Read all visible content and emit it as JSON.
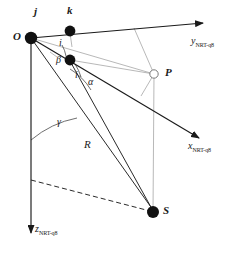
{
  "figure": {
    "kind": "geometry-diagram",
    "background_color": "#ffffff",
    "line_color": "#1a1a1a",
    "thin_line_color": "#8a8a8a",
    "node_fill_color": "#111111",
    "open_node_fill_color": "#ffffff"
  },
  "axes": [
    {
      "id": "y-axis",
      "name": "y-axis",
      "base_symbol": "y",
      "subscript": "NRT-q8",
      "label_x": 191,
      "label_y": 42,
      "from": [
        31,
        38
      ],
      "to": [
        206,
        22
      ],
      "arrow": true
    },
    {
      "id": "x-axis",
      "name": "x-axis",
      "base_symbol": "x",
      "subscript": "NRT-q8",
      "label_x": 188,
      "label_y": 147,
      "from": [
        31,
        38
      ],
      "to": [
        202,
        140
      ],
      "arrow": true
    },
    {
      "id": "z-axis",
      "name": "z-axis",
      "base_symbol": "z",
      "subscript": "NRT-q8",
      "label_x": 34,
      "label_y": 229,
      "from": [
        31,
        38
      ],
      "to": [
        31,
        236
      ],
      "arrow": true
    }
  ],
  "points": [
    {
      "id": "O",
      "name": "origin-point",
      "label": "O",
      "x": 31,
      "y": 38,
      "label_x": 14,
      "label_y": 33,
      "marker": "filled",
      "radius": 6
    },
    {
      "id": "j",
      "name": "point-j",
      "label": "j",
      "x": 31,
      "y": 38,
      "label_x": 34,
      "label_y": 9,
      "marker": "none",
      "radius": 0
    },
    {
      "id": "k",
      "name": "point-k",
      "label": "k",
      "x": 70,
      "y": 31,
      "label_x": 67,
      "label_y": 8,
      "marker": "filled",
      "radius": 5
    },
    {
      "id": "i",
      "name": "point-i",
      "label": "",
      "x": 70,
      "y": 60,
      "label_x": 0,
      "label_y": 0,
      "marker": "filled",
      "radius": 5
    },
    {
      "id": "P",
      "name": "point-P",
      "label": "P",
      "x": 154,
      "y": 74,
      "label_x": 165,
      "label_y": 70,
      "marker": "open",
      "radius": 4
    },
    {
      "id": "S",
      "name": "point-S",
      "label": "S",
      "x": 153,
      "y": 212,
      "label_x": 163,
      "label_y": 207,
      "marker": "filled",
      "radius": 6
    }
  ],
  "angles": [
    {
      "id": "alpha",
      "name": "angle-alpha",
      "label": "α",
      "label_x": 87,
      "label_y": 82
    },
    {
      "id": "beta",
      "name": "angle-beta",
      "label": "β",
      "label_x": 57,
      "label_y": 61
    },
    {
      "id": "i",
      "name": "angle-i",
      "label": "i",
      "label_x": 74,
      "label_y": 76
    },
    {
      "id": "gamma",
      "name": "angle-gamma",
      "label": "γ",
      "label_x": 57,
      "label_y": 122
    },
    {
      "id": "i-top",
      "name": "angle-i-top",
      "label": "i",
      "label_x": 59,
      "label_y": 43
    }
  ],
  "segments": [
    {
      "id": "R",
      "name": "segment-R",
      "label": "R",
      "label_x": 84,
      "label_y": 145,
      "from": [
        31,
        38
      ],
      "to": [
        153,
        212
      ]
    }
  ],
  "lines": {
    "ray_to_P": {
      "name": "ray-O-to-P",
      "from": [
        31,
        38
      ],
      "to": [
        154,
        74
      ]
    },
    "ray_to_x_through_P": {
      "name": "ray-through-P-to-x-axis",
      "from": [
        31,
        38
      ],
      "to": [
        202,
        140
      ]
    },
    "ray_O_to_S": {
      "name": "ray-O-to-S",
      "from": [
        31,
        38
      ],
      "to": [
        153,
        212
      ]
    },
    "ray_i_to_S": {
      "name": "ray-i-dot-to-S",
      "from": [
        70,
        60
      ],
      "to": [
        153,
        212
      ]
    },
    "drop_P_to_S": {
      "name": "vertical-drop-P-to-S",
      "from": [
        154,
        74
      ],
      "to": [
        153,
        212
      ]
    },
    "perp_P_to_y": {
      "name": "perpendicular-P-to-y-axis",
      "from": [
        154,
        74
      ],
      "to": [
        134,
        28
      ]
    },
    "perp_k_to_ray": {
      "name": "perpendicular-k-to-ray",
      "from": [
        70,
        31
      ],
      "to": [
        72,
        46
      ]
    },
    "perp_tick_P": {
      "name": "right-angle-tick-at-P",
      "from": [
        154,
        74
      ],
      "to": [
        141,
        96
      ]
    },
    "dashed_ground": {
      "name": "dashed-ground-line",
      "from": [
        31,
        180
      ],
      "to": [
        153,
        212
      ],
      "dashed": true
    }
  },
  "meta": {
    "width": 241,
    "height": 253
  }
}
